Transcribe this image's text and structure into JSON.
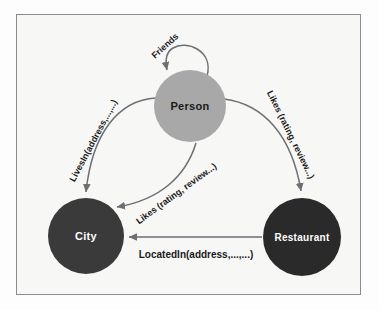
{
  "diagram": {
    "background_color": "#f7f7f6",
    "frame_color": "#8a8a90",
    "edge_color": "#6e6e73"
  },
  "nodes": [
    {
      "id": "person",
      "label": "Person",
      "fill": "#a8a8a8",
      "text_color": "#1a1a1a",
      "cx": 190,
      "cy": 106,
      "r": 36,
      "font_size": 11
    },
    {
      "id": "city",
      "label": "City",
      "fill": "#3a3a3a",
      "text_color": "#ffffff",
      "cx": 86,
      "cy": 236,
      "r": 38,
      "font_size": 11
    },
    {
      "id": "restaurant",
      "label": "Restaurant",
      "fill": "#2a2a2a",
      "text_color": "#ffffff",
      "cx": 302,
      "cy": 237,
      "r": 39,
      "font_size": 10
    }
  ],
  "edges": [
    {
      "id": "friends",
      "label": "Friends",
      "from": "person",
      "to": "person",
      "type": "self-loop",
      "font_size": 9
    },
    {
      "id": "lives-in",
      "label": "LivesIn(address,...,...)",
      "from": "person",
      "to": "city",
      "type": "curve",
      "font_size": 9
    },
    {
      "id": "likes-restaurant",
      "label": "Likes (rating, review...)",
      "from": "person",
      "to": "restaurant",
      "type": "curve",
      "font_size": 9
    },
    {
      "id": "likes-city",
      "label": "Likes (rating, review...)",
      "from": "person",
      "to": "city",
      "type": "curve",
      "font_size": 9
    },
    {
      "id": "located-in",
      "label": "LocatedIn(address,...,...)",
      "from": "restaurant",
      "to": "city",
      "type": "straight",
      "font_size": 10
    }
  ]
}
